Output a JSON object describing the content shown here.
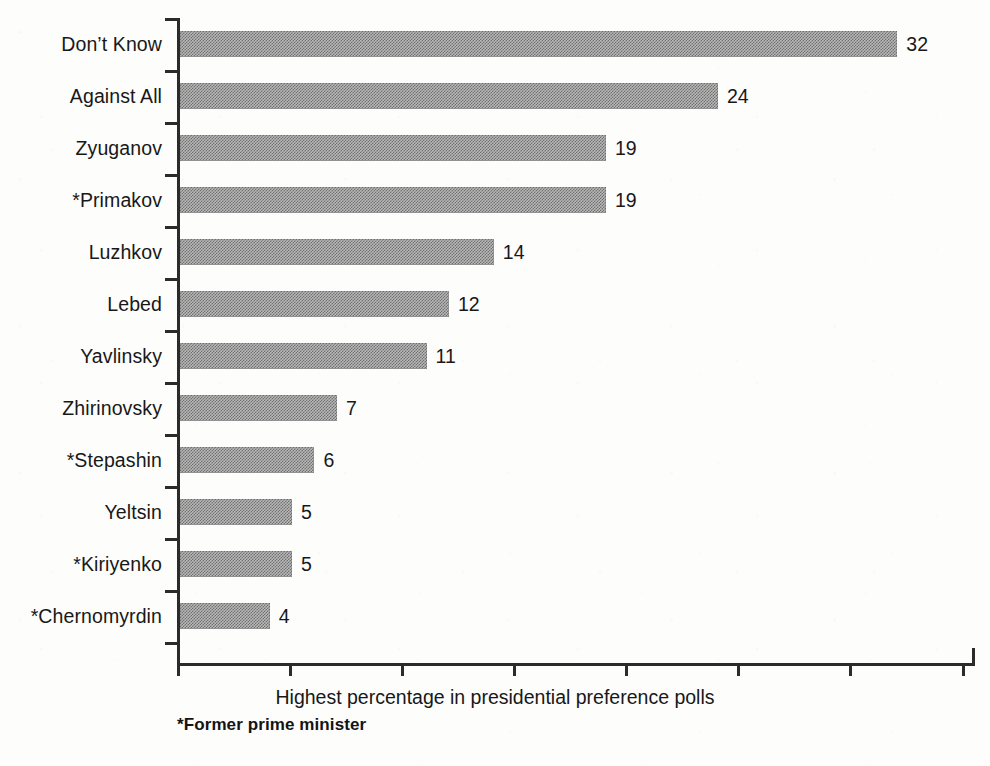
{
  "chart_data": {
    "type": "bar",
    "orientation": "horizontal",
    "title": "",
    "xlabel": "Highest percentage in presidential preference polls",
    "ylabel": "",
    "categories": [
      "Don’t Know",
      "Against All",
      "Zyuganov",
      "*Primakov",
      "Luzhkov",
      "Lebed",
      "Yavlinsky",
      "Zhirinovsky",
      "*Stepashin",
      "Yeltsin",
      "*Kiriyenko",
      "*Chernomyrdin"
    ],
    "values": [
      32,
      24,
      19,
      19,
      14,
      12,
      11,
      7,
      6,
      5,
      5,
      4
    ],
    "value_labels": [
      "32",
      "24",
      "19",
      "19",
      "14",
      "12",
      "11",
      "7",
      "6",
      "5",
      "5",
      "4"
    ],
    "xlim": [
      0,
      35.6
    ],
    "x_tick_values": [
      0,
      5,
      10,
      15,
      20,
      25,
      30,
      35
    ],
    "x_tick_labels": [
      "",
      "",
      "",
      "",
      "",
      "",
      "",
      ""
    ],
    "grid": false,
    "legend": false,
    "bar_fill": "halftone-gray",
    "bar_color": "#8f8f8f",
    "axis_color": "#2b2b2b",
    "background": "#fdfdfc"
  },
  "footnote": "*Former prime minister"
}
